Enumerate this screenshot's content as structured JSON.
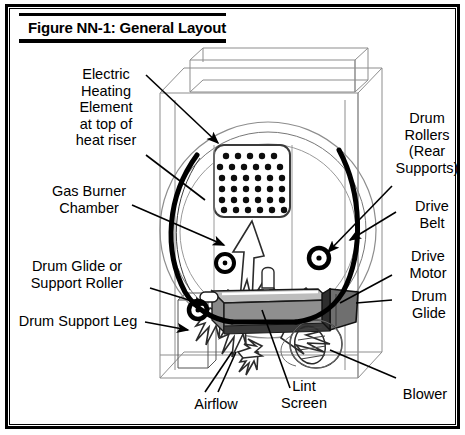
{
  "figure": {
    "title": "Figure NN-1: General Layout",
    "border_color": "#000000",
    "background_color": "#ffffff"
  },
  "labels": {
    "electric_heating_element": "Electric\nHeating\nElement\nat top of\nheat riser",
    "gas_burner_chamber": "Gas Burner\nChamber",
    "drum_glide_or_support_roller": "Drum Glide or\nSupport Roller",
    "drum_support_leg": "Drum Support Leg",
    "drum_rollers_rear_supports": "Drum\nRollers\n(Rear\nSupports)",
    "drive_belt": "Drive\nBelt",
    "drive_motor": "Drive\nMotor",
    "drum_glide": "Drum\nGlide",
    "blower": "Blower",
    "lint_screen": "Lint\nScreen",
    "airflow": "Airflow"
  },
  "diagram": {
    "components": [
      "cabinet",
      "top-console",
      "drum",
      "heater-perforated-panel",
      "drive-belt",
      "drive-motor",
      "drum-rollers",
      "drum-glide",
      "lint-screen",
      "blower-wheel",
      "airflow-arrows",
      "drum-support-leg"
    ],
    "colors": {
      "line": "#000000",
      "light_line": "#9a9a9a",
      "lint_screen_fill": "#8c8c8c",
      "lint_screen_dark": "#5a5a5a",
      "motor_fill": "#7d7d7d",
      "arrow_fill": "#ffffff"
    }
  }
}
